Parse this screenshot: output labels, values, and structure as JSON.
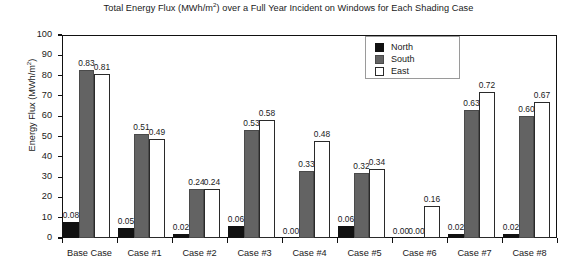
{
  "chart_data": {
    "type": "bar",
    "title_main": "Total Energy Flux (MWh/m",
    "title_sup": "2",
    "title_tail": ") over a Full Year Incident on Windows for Each Shading Case",
    "xlabel": "",
    "ylabel": "Energy Flux (MWh/m²)",
    "ylabel_main": "Energy Flux (MWh/m",
    "ylabel_sup": "2",
    "ylabel_tail": ")",
    "ylim": [
      0,
      100
    ],
    "ytick_labels": [
      "100",
      "90",
      "80",
      "70",
      "60",
      "50",
      "40",
      "30",
      "20",
      "10",
      "0"
    ],
    "ytick_values": [
      100,
      90,
      80,
      70,
      60,
      50,
      40,
      30,
      20,
      10,
      0
    ],
    "grid": false,
    "legend_position": "upper center",
    "categories": [
      "Base Case",
      "Case #1",
      "Case #2",
      "Case #3",
      "Case #4",
      "Case #5",
      "Case #6",
      "Case #7",
      "Case #8"
    ],
    "series": [
      {
        "name": "North",
        "color": "#111111",
        "values": [
          8,
          5,
          2,
          6,
          0,
          6,
          0,
          2,
          2
        ],
        "labels": [
          "0.08",
          "0.05",
          "0.02",
          "0.06",
          "0.00",
          "0.06",
          "0.00",
          "0.02",
          "0.02"
        ]
      },
      {
        "name": "South",
        "color": "#636363",
        "values": [
          83,
          51,
          24,
          53,
          33,
          32,
          0,
          63,
          60
        ],
        "labels": [
          "0.83",
          "0.51",
          "0.24",
          "0.53",
          "0.33",
          "0.32",
          "0.00",
          "0.63",
          "0.60"
        ]
      },
      {
        "name": "East",
        "color": "#ffffff",
        "values": [
          81,
          49,
          24,
          58,
          48,
          34,
          16,
          72,
          67
        ],
        "labels": [
          "0.81",
          "0.49",
          "0.24",
          "0.58",
          "0.48",
          "0.34",
          "0.16",
          "0.72",
          "0.67"
        ]
      }
    ]
  },
  "legend": {
    "items": [
      {
        "label": "North",
        "swatch": "north"
      },
      {
        "label": "South",
        "swatch": "south"
      },
      {
        "label": "East",
        "swatch": "east"
      }
    ]
  }
}
